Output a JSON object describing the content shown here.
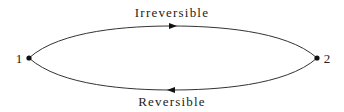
{
  "diagram": {
    "type": "thermodynamic-cycle",
    "upper_path": {
      "label": "Irreversible",
      "direction": "1 to 2"
    },
    "lower_path": {
      "label": "Reversible",
      "direction": "2 to 1"
    },
    "points": [
      {
        "id": "1",
        "label": "1"
      },
      {
        "id": "2",
        "label": "2"
      }
    ],
    "colors": {
      "line": "#333333",
      "text": "#222222",
      "point": "#111111"
    }
  }
}
